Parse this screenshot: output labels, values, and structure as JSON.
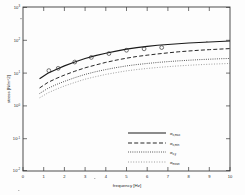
{
  "chart_data": {
    "type": "line",
    "title": "",
    "xlabel": "frequency [Hz]",
    "ylabel": "stress [N/m^2]",
    "xlim": [
      0,
      10
    ],
    "ylim_exponent": [
      -2,
      3
    ],
    "yscale": "log",
    "xscale": "linear",
    "grid": false,
    "legend_position": "lower-center-right",
    "xticks": [
      "0",
      "1",
      "2",
      "3",
      "4",
      "5",
      "6",
      "7",
      "8",
      "9",
      "10"
    ],
    "yticks": [
      {
        "label": "10",
        "exp": "3"
      },
      {
        "label": "10",
        "exp": "2"
      },
      {
        "label": "10",
        "exp": "1"
      },
      {
        "label": "10",
        "exp": "0"
      },
      {
        "label": "10",
        "exp": "-1"
      },
      {
        "label": "10",
        "exp": "-2"
      }
    ],
    "x": [
      0.8,
      1.2,
      1.6,
      2.0,
      2.5,
      3.0,
      3.5,
      4.0,
      4.5,
      5.0,
      5.5,
      6.0,
      6.5,
      7.0,
      7.5,
      8.0,
      8.5,
      9.0,
      9.5,
      10.0
    ],
    "series": [
      {
        "name": "sigma_xmax",
        "label": "σ",
        "sublabel": "x,max",
        "style": "solid",
        "values": [
          6.5,
          9.5,
          12.5,
          16.0,
          21.0,
          27.0,
          33.0,
          39.0,
          45.0,
          52.0,
          58.0,
          63.0,
          68.0,
          72.0,
          76.0,
          80.0,
          83.0,
          86.0,
          89.0,
          92.0
        ]
      },
      {
        "name": "sigma_xmin",
        "label": "σ",
        "sublabel": "x,min",
        "style": "dashed",
        "values": [
          3.4,
          5.0,
          6.6,
          8.4,
          11.0,
          14.0,
          17.0,
          20.5,
          24.0,
          27.5,
          31.0,
          34.0,
          37.0,
          40.0,
          43.0,
          45.5,
          48.0,
          50.0,
          52.0,
          54.0
        ]
      },
      {
        "name": "sigma_xy",
        "label": "σ",
        "sublabel": "x,y",
        "style": "dashdot",
        "values": [
          2.3,
          3.3,
          4.3,
          5.4,
          7.0,
          8.8,
          10.6,
          12.4,
          14.2,
          16.0,
          17.6,
          19.0,
          20.4,
          21.6,
          22.8,
          23.8,
          24.8,
          25.6,
          26.4,
          27.0
        ]
      },
      {
        "name": "sigma_mean",
        "label": "σ",
        "sublabel": "mean",
        "style": "dotted",
        "values": [
          1.7,
          2.4,
          3.1,
          3.9,
          5.0,
          6.3,
          7.5,
          8.8,
          10.0,
          11.3,
          12.4,
          13.4,
          14.3,
          15.2,
          16.0,
          16.7,
          17.4,
          18.0,
          18.5,
          19.0
        ]
      }
    ],
    "markers": {
      "series": "sigma_xmax",
      "symbol": "circle",
      "x": [
        1.25,
        1.7,
        2.5,
        3.3,
        4.15,
        5.0,
        5.85,
        6.7
      ],
      "y": [
        11.5,
        13.5,
        21.0,
        29.0,
        38.0,
        48.0,
        53.0,
        58.0
      ]
    }
  }
}
